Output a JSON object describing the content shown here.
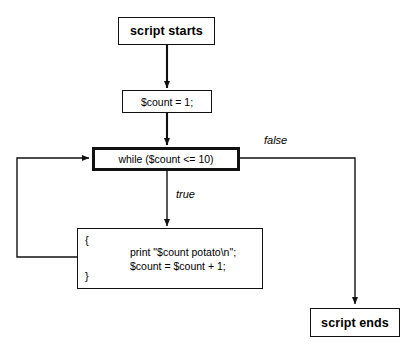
{
  "diagram": {
    "colors": {
      "line": "#111111",
      "background": "#ffffff",
      "text": "#000000"
    },
    "nodes": {
      "start": {
        "label": "script starts",
        "shape": "rectangle"
      },
      "init": {
        "label": "$count = 1;",
        "shape": "rectangle"
      },
      "condition": {
        "label": "while ($count <= 10)",
        "shape": "rectangle-bold"
      },
      "body": {
        "open_brace": "{",
        "close_brace": "}",
        "code": "print \"$count potato\\n\";\n$count = $count + 1;",
        "shape": "rectangle"
      },
      "end": {
        "label": "script ends",
        "shape": "rectangle"
      }
    },
    "edges": [
      {
        "from": "start",
        "to": "init",
        "label": ""
      },
      {
        "from": "init",
        "to": "condition",
        "label": ""
      },
      {
        "from": "condition",
        "to": "body",
        "label": "true"
      },
      {
        "from": "condition",
        "to": "end",
        "label": "false"
      },
      {
        "from": "body",
        "to": "condition",
        "label": ""
      }
    ],
    "labels": {
      "true": "true",
      "false": "false"
    }
  }
}
